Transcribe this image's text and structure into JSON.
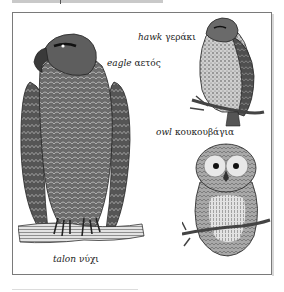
{
  "illustration": {
    "title": "Birds of prey",
    "birds": [
      {
        "id": "eagle",
        "english": "eagle",
        "greek": "αετός"
      },
      {
        "id": "hawk",
        "english": "hawk",
        "greek": "γεράκι"
      },
      {
        "id": "owl",
        "english": "owl",
        "greek": "κουκουβάγια"
      }
    ],
    "parts": [
      {
        "id": "talon",
        "english": "talon",
        "greek": "νύχι"
      }
    ]
  },
  "colors": {
    "ink": "#222222",
    "frame": "#7a7a7a",
    "rule": "#dcdcdc",
    "header_bar": "#c9c9c9"
  }
}
